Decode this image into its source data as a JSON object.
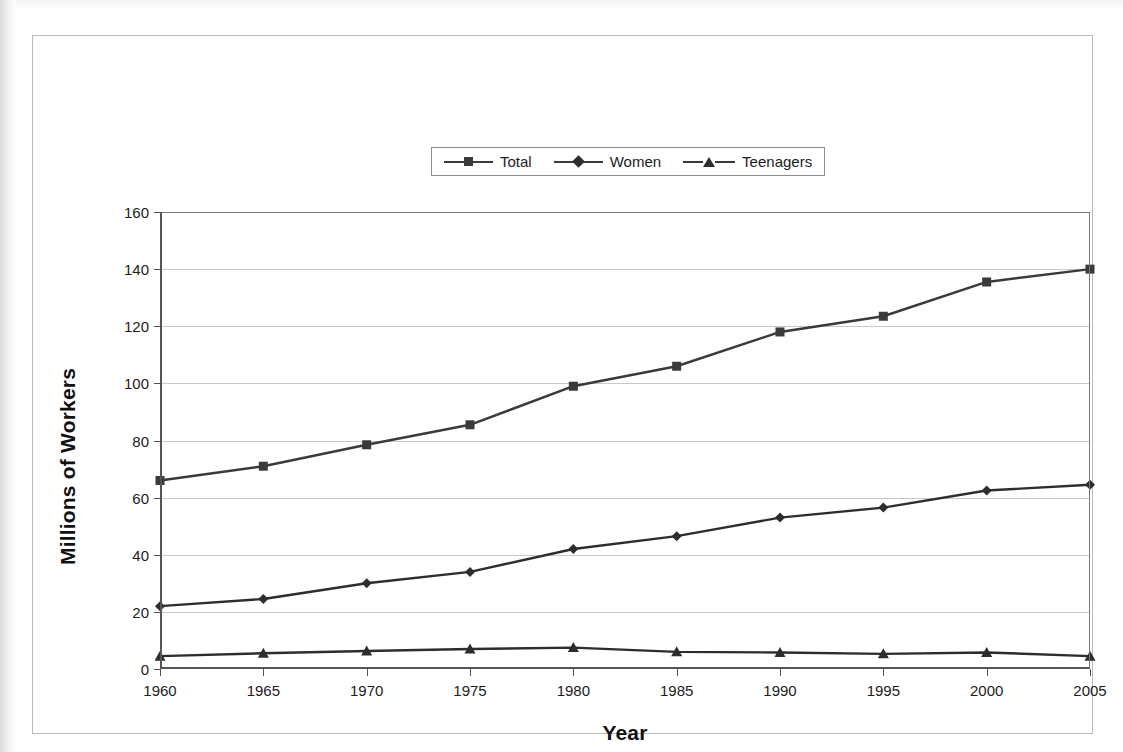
{
  "chart_data": {
    "type": "line",
    "title": "",
    "xlabel": "Year",
    "ylabel": "Millions of Workers",
    "x": [
      1960,
      1965,
      1970,
      1975,
      1980,
      1985,
      1990,
      1995,
      2000,
      2005
    ],
    "categories": [
      "1960",
      "1965",
      "1970",
      "1975",
      "1980",
      "1985",
      "1990",
      "1995",
      "2000",
      "2005"
    ],
    "xlim": [
      1960,
      2005
    ],
    "ylim": [
      0,
      160
    ],
    "ytick_step": 20,
    "yticks": [
      0,
      20,
      40,
      60,
      80,
      100,
      120,
      140,
      160
    ],
    "ytick_labels": [
      "0",
      "20",
      "40",
      "60",
      "80",
      "100",
      "120",
      "140",
      "160"
    ],
    "grid": "horizontal",
    "legend_position": "top-center",
    "series": [
      {
        "name": "Total",
        "marker": "square",
        "color": "#3a3a3a",
        "values": [
          66,
          71,
          78.5,
          85.5,
          99,
          106,
          118,
          123.5,
          135.5,
          140
        ]
      },
      {
        "name": "Women",
        "marker": "diamond",
        "color": "#2d2d2d",
        "values": [
          22,
          24.5,
          30,
          34,
          42,
          46.5,
          53,
          56.5,
          62.5,
          64.5
        ]
      },
      {
        "name": "Teenagers",
        "marker": "triangle",
        "color": "#2d2d2d",
        "values": [
          4.5,
          5.5,
          6.3,
          7,
          7.5,
          6,
          5.8,
          5.3,
          5.8,
          4.5
        ]
      }
    ]
  },
  "legend": {
    "entries": [
      {
        "label": "Total"
      },
      {
        "label": "Women"
      },
      {
        "label": "Teenagers"
      }
    ]
  },
  "axis_titles": {
    "y": "Millions of Workers",
    "x": "Year"
  }
}
